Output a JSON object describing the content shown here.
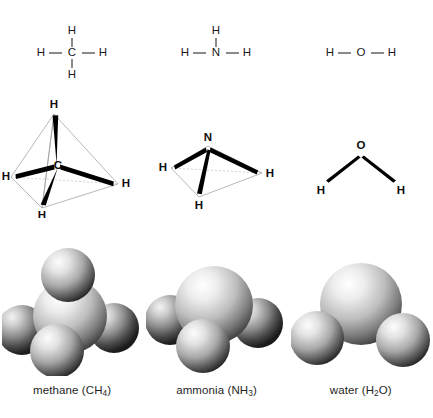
{
  "figure": {
    "background_color": "#ffffff",
    "bond_color": "#2b2b2b",
    "wedge_color": "#000000",
    "edge_color": "#9a9a9a",
    "label_color": "#1a1a1a"
  },
  "molecules": [
    {
      "id": "methane",
      "caption_name": "methane",
      "caption_formula_base": "CH",
      "caption_formula_sub": "4",
      "caption_full": "methane (CH4)",
      "central_atom": "C",
      "hydrogen_label": "H",
      "hydrogen_count": 4,
      "geometry": "tetrahedral",
      "lewis": {
        "center": "C",
        "top": "H",
        "bottom": "H",
        "left": "H",
        "right": "H"
      },
      "spheres": [
        {
          "atom": "C",
          "role": "central"
        },
        {
          "atom": "H",
          "role": "top"
        },
        {
          "atom": "H",
          "role": "front"
        },
        {
          "atom": "H",
          "role": "left"
        },
        {
          "atom": "H",
          "role": "right"
        }
      ]
    },
    {
      "id": "ammonia",
      "caption_name": "ammonia",
      "caption_formula_base": "NH",
      "caption_formula_sub": "3",
      "caption_full": "ammonia (NH3)",
      "central_atom": "N",
      "hydrogen_label": "H",
      "hydrogen_count": 3,
      "geometry": "trigonal pyramidal",
      "lewis": {
        "center": "N",
        "top": "H",
        "left": "H",
        "right": "H"
      },
      "spheres": [
        {
          "atom": "N",
          "role": "central"
        },
        {
          "atom": "H",
          "role": "front"
        },
        {
          "atom": "H",
          "role": "left"
        },
        {
          "atom": "H",
          "role": "right"
        }
      ]
    },
    {
      "id": "water",
      "caption_name": "water",
      "caption_formula_base": "H",
      "caption_formula_sub": "2",
      "caption_formula_tail": "O",
      "caption_full": "water (H2O)",
      "central_atom": "O",
      "hydrogen_label": "H",
      "hydrogen_count": 2,
      "geometry": "bent",
      "lewis": {
        "center": "O",
        "left": "H",
        "right": "H"
      },
      "spheres": [
        {
          "atom": "O",
          "role": "central"
        },
        {
          "atom": "H",
          "role": "left"
        },
        {
          "atom": "H",
          "role": "right"
        }
      ]
    }
  ]
}
